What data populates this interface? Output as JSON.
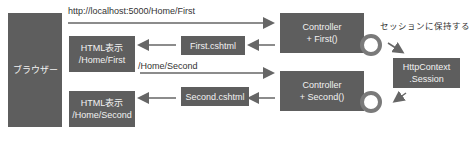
{
  "browser": {
    "label": "ブラウザー"
  },
  "request1": {
    "url": "http://localhost:5000/Home/First"
  },
  "request2": {
    "url": "/Home/Second"
  },
  "html1": {
    "line1": "HTML表示",
    "line2": "/Home/First"
  },
  "html2": {
    "line1": "HTML表示",
    "line2": "/Home/Second"
  },
  "view1": {
    "label": "First.cshtml"
  },
  "view2": {
    "label": "Second.cshtml"
  },
  "controller1": {
    "line1": "Controller",
    "line2": "+ First()"
  },
  "controller2": {
    "line1": "Controller",
    "line2": "+ Second()"
  },
  "session": {
    "line1": "HttpContext",
    "line2": ".Session"
  },
  "session_note": {
    "label": "セッションに保持する"
  },
  "colors": {
    "box": "#5e5e5e",
    "arrow": "#666666",
    "ring": "#7a7a7a"
  }
}
